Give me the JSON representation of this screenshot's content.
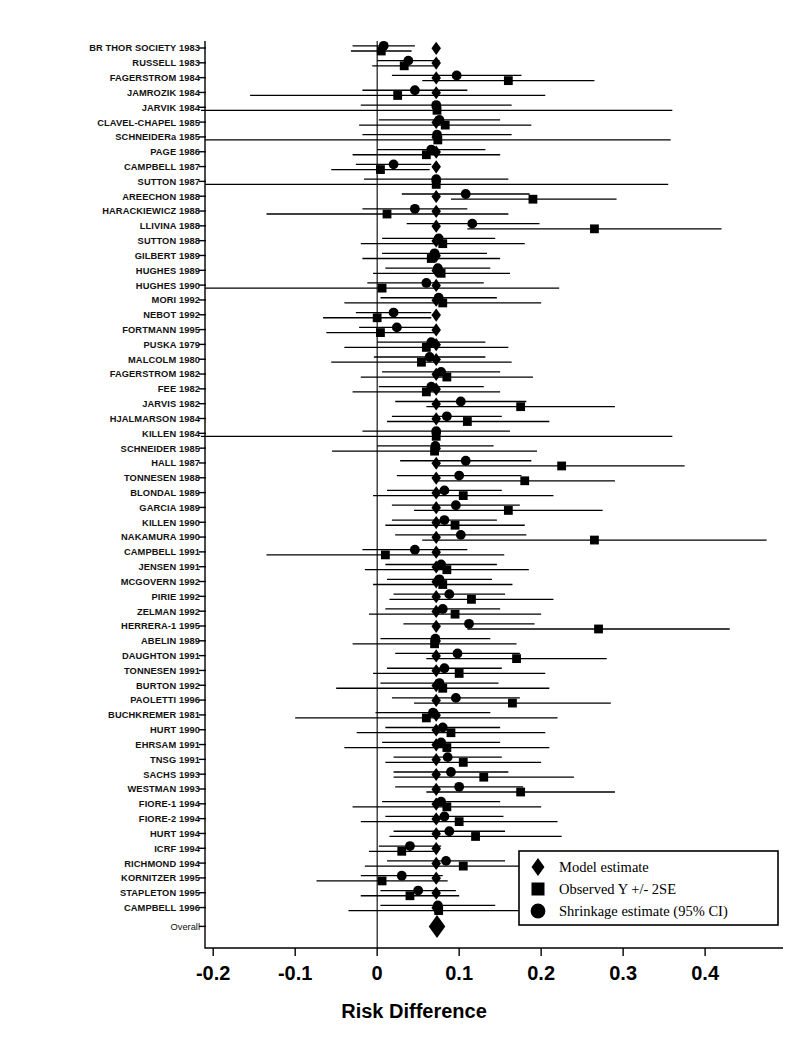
{
  "figure": {
    "type": "forest-plot",
    "background": "#ffffff",
    "ink_color": "#000000",
    "width": 787,
    "height": 1043
  },
  "axis": {
    "title": "Risk Difference",
    "tick_labels": [
      "-0.2",
      "-0.1",
      "0",
      "0.1",
      "0.2",
      "0.3",
      "0.4"
    ],
    "tick_values": [
      -0.2,
      -0.1,
      0,
      0.1,
      0.2,
      0.3,
      0.4
    ],
    "xlim": [
      -0.21,
      0.495
    ],
    "reference_line": 0
  },
  "legend": {
    "position": "bottom-right",
    "items": [
      {
        "marker": "diamond",
        "label": "Model estimate"
      },
      {
        "marker": "square",
        "label": "Observed Y +/- 2SE"
      },
      {
        "marker": "circle",
        "label": "Shrinkage estimate (95% CI)"
      }
    ]
  },
  "overall": {
    "label": "Overall",
    "model_estimate": 0.073
  },
  "chart_data": {
    "type": "scatter",
    "title": "",
    "xlabel": "Risk Difference",
    "ylabel": "",
    "xlim": [
      -0.21,
      0.495
    ],
    "grid": false,
    "legend_position": "bottom-right",
    "series": [
      {
        "name": "Model estimate",
        "marker": "diamond"
      },
      {
        "name": "Observed Y +/- 2SE",
        "marker": "square"
      },
      {
        "name": "Shrinkage estimate (95% CI)",
        "marker": "circle"
      }
    ],
    "categories": [
      "BR THOR SOCIETY 1983",
      "RUSSELL 1983",
      "FAGERSTROM 1984",
      "JAMROZIK 1984",
      "JARVIK 1984",
      "CLAVEL-CHAPEL 1985",
      "SCHNEIDERa 1985",
      "PAGE 1986",
      "CAMPBELL 1987",
      "SUTTON 1987",
      "AREECHON 1988",
      "HARACKIEWICZ 1988",
      "LLIVINA 1988",
      "SUTTON 1988",
      "GILBERT 1989",
      "HUGHES 1989",
      "HUGHES 1990",
      "MORI 1992",
      "NEBOT 1992",
      "FORTMANN 1995",
      "PUSKA 1979",
      "MALCOLM 1980",
      "FAGERSTROM 1982",
      "FEE 1982",
      "JARVIS 1982",
      "HJALMARSON 1984",
      "KILLEN 1984",
      "SCHNEIDER 1985",
      "HALL 1987",
      "TONNESEN 1988",
      "BLONDAL 1989",
      "GARCIA 1989",
      "KILLEN 1990",
      "NAKAMURA 1990",
      "CAMPBELL 1991",
      "JENSEN 1991",
      "MCGOVERN 1992",
      "PIRIE 1992",
      "ZELMAN 1992",
      "HERRERA-1 1995",
      "ABELIN 1989",
      "DAUGHTON 1991",
      "TONNESEN 1991",
      "BURTON 1992",
      "PAOLETTI 1996",
      "BUCHKREMER 1981",
      "HURT 1990",
      "EHRSAM 1991",
      "TNSG 1991",
      "SACHS 1993",
      "WESTMAN 1993",
      "FIORE-1 1994",
      "FIORE-2 1994",
      "HURT 1994",
      "ICRF 1994",
      "RICHMOND 1994",
      "KORNITZER 1995",
      "STAPLETON 1995",
      "CAMPBELL 1996"
    ],
    "rows": [
      {
        "study": "BR THOR SOCIETY 1983",
        "model": 0.072,
        "observed": 0.005,
        "se_lo": -0.032,
        "se_hi": 0.042,
        "shrink": 0.008,
        "ci_lo": -0.03,
        "ci_hi": 0.046
      },
      {
        "study": "RUSSELL 1983",
        "model": 0.072,
        "observed": 0.033,
        "se_lo": -0.006,
        "se_hi": 0.072,
        "shrink": 0.038,
        "ci_lo": 0.0,
        "ci_hi": 0.076
      },
      {
        "study": "FAGERSTROM 1984",
        "model": 0.072,
        "observed": 0.16,
        "se_lo": 0.055,
        "se_hi": 0.265,
        "shrink": 0.097,
        "ci_lo": 0.018,
        "ci_hi": 0.176
      },
      {
        "study": "JAMROZIK 1984",
        "model": 0.072,
        "observed": 0.025,
        "se_lo": -0.155,
        "se_hi": 0.205,
        "shrink": 0.046,
        "ci_lo": -0.018,
        "ci_hi": 0.11
      },
      {
        "study": "JARVIK 1984",
        "model": 0.072,
        "observed": 0.073,
        "se_lo": -0.215,
        "se_hi": 0.36,
        "shrink": 0.072,
        "ci_lo": -0.02,
        "ci_hi": 0.164
      },
      {
        "study": "CLAVEL-CHAPEL 1985",
        "model": 0.072,
        "observed": 0.083,
        "se_lo": -0.022,
        "se_hi": 0.188,
        "shrink": 0.076,
        "ci_lo": 0.002,
        "ci_hi": 0.15
      },
      {
        "study": "SCHNEIDERa 1985",
        "model": 0.072,
        "observed": 0.074,
        "se_lo": -0.21,
        "se_hi": 0.358,
        "shrink": 0.073,
        "ci_lo": -0.018,
        "ci_hi": 0.164
      },
      {
        "study": "PAGE 1986",
        "model": 0.072,
        "observed": 0.06,
        "se_lo": -0.03,
        "se_hi": 0.15,
        "shrink": 0.066,
        "ci_lo": 0.0,
        "ci_hi": 0.132
      },
      {
        "study": "CAMPBELL 1987",
        "model": 0.072,
        "observed": 0.004,
        "se_lo": -0.056,
        "se_hi": 0.064,
        "shrink": 0.02,
        "ci_lo": -0.026,
        "ci_hi": 0.066
      },
      {
        "study": "SUTTON 1987",
        "model": 0.072,
        "observed": 0.072,
        "se_lo": -0.21,
        "se_hi": 0.355,
        "shrink": 0.072,
        "ci_lo": -0.016,
        "ci_hi": 0.16
      },
      {
        "study": "AREECHON 1988",
        "model": 0.072,
        "observed": 0.19,
        "se_lo": 0.09,
        "se_hi": 0.292,
        "shrink": 0.108,
        "ci_lo": 0.03,
        "ci_hi": 0.186
      },
      {
        "study": "HARACKIEWICZ 1988",
        "model": 0.072,
        "observed": 0.012,
        "se_lo": -0.135,
        "se_hi": 0.16,
        "shrink": 0.046,
        "ci_lo": -0.018,
        "ci_hi": 0.11
      },
      {
        "study": "LLIVINA 1988",
        "model": 0.072,
        "observed": 0.265,
        "se_lo": 0.11,
        "se_hi": 0.42,
        "shrink": 0.116,
        "ci_lo": 0.036,
        "ci_hi": 0.198
      },
      {
        "study": "SUTTON 1988",
        "model": 0.072,
        "observed": 0.08,
        "se_lo": -0.02,
        "se_hi": 0.18,
        "shrink": 0.075,
        "ci_lo": 0.006,
        "ci_hi": 0.144
      },
      {
        "study": "GILBERT 1989",
        "model": 0.072,
        "observed": 0.066,
        "se_lo": -0.018,
        "se_hi": 0.15,
        "shrink": 0.07,
        "ci_lo": 0.006,
        "ci_hi": 0.134
      },
      {
        "study": "HUGHES 1989",
        "model": 0.072,
        "observed": 0.078,
        "se_lo": -0.005,
        "se_hi": 0.162,
        "shrink": 0.074,
        "ci_lo": 0.01,
        "ci_hi": 0.138
      },
      {
        "study": "HUGHES 1990",
        "model": 0.072,
        "observed": 0.006,
        "se_lo": -0.21,
        "se_hi": 0.222,
        "shrink": 0.06,
        "ci_lo": -0.012,
        "ci_hi": 0.13
      },
      {
        "study": "MORI 1992",
        "model": 0.072,
        "observed": 0.08,
        "se_lo": -0.04,
        "se_hi": 0.2,
        "shrink": 0.075,
        "ci_lo": 0.004,
        "ci_hi": 0.146
      },
      {
        "study": "NEBOT 1992",
        "model": 0.072,
        "observed": 0.0,
        "se_lo": -0.066,
        "se_hi": 0.066,
        "shrink": 0.02,
        "ci_lo": -0.026,
        "ci_hi": 0.066
      },
      {
        "study": "FORTMANN 1995",
        "model": 0.072,
        "observed": 0.004,
        "se_lo": -0.062,
        "se_hi": 0.07,
        "shrink": 0.024,
        "ci_lo": -0.022,
        "ci_hi": 0.07
      },
      {
        "study": "PUSKA 1979",
        "model": 0.072,
        "observed": 0.06,
        "se_lo": -0.04,
        "se_hi": 0.16,
        "shrink": 0.066,
        "ci_lo": 0.0,
        "ci_hi": 0.132
      },
      {
        "study": "MALCOLM 1980",
        "model": 0.072,
        "observed": 0.054,
        "se_lo": -0.056,
        "se_hi": 0.164,
        "shrink": 0.064,
        "ci_lo": -0.004,
        "ci_hi": 0.132
      },
      {
        "study": "FAGERSTROM 1982",
        "model": 0.072,
        "observed": 0.085,
        "se_lo": -0.02,
        "se_hi": 0.19,
        "shrink": 0.078,
        "ci_lo": 0.006,
        "ci_hi": 0.15
      },
      {
        "study": "FEE 1982",
        "model": 0.072,
        "observed": 0.06,
        "se_lo": -0.03,
        "se_hi": 0.15,
        "shrink": 0.066,
        "ci_lo": 0.002,
        "ci_hi": 0.13
      },
      {
        "study": "JARVIS 1982",
        "model": 0.072,
        "observed": 0.175,
        "se_lo": 0.06,
        "se_hi": 0.29,
        "shrink": 0.102,
        "ci_lo": 0.022,
        "ci_hi": 0.182
      },
      {
        "study": "HJALMARSON 1984",
        "model": 0.072,
        "observed": 0.11,
        "se_lo": 0.012,
        "se_hi": 0.21,
        "shrink": 0.085,
        "ci_lo": 0.018,
        "ci_hi": 0.152
      },
      {
        "study": "KILLEN 1984",
        "model": 0.072,
        "observed": 0.072,
        "se_lo": -0.215,
        "se_hi": 0.36,
        "shrink": 0.072,
        "ci_lo": -0.018,
        "ci_hi": 0.162
      },
      {
        "study": "SCHNEIDER 1985",
        "model": 0.072,
        "observed": 0.07,
        "se_lo": -0.055,
        "se_hi": 0.195,
        "shrink": 0.071,
        "ci_lo": 0.0,
        "ci_hi": 0.142
      },
      {
        "study": "HALL 1987",
        "model": 0.072,
        "observed": 0.225,
        "se_lo": 0.075,
        "se_hi": 0.375,
        "shrink": 0.108,
        "ci_lo": 0.028,
        "ci_hi": 0.188
      },
      {
        "study": "TONNESEN 1988",
        "model": 0.072,
        "observed": 0.18,
        "se_lo": 0.07,
        "se_hi": 0.29,
        "shrink": 0.1,
        "ci_lo": 0.024,
        "ci_hi": 0.176
      },
      {
        "study": "BLONDAL 1989",
        "model": 0.072,
        "observed": 0.105,
        "se_lo": -0.005,
        "se_hi": 0.215,
        "shrink": 0.082,
        "ci_lo": 0.012,
        "ci_hi": 0.152
      },
      {
        "study": "GARCIA 1989",
        "model": 0.072,
        "observed": 0.16,
        "se_lo": 0.045,
        "se_hi": 0.275,
        "shrink": 0.096,
        "ci_lo": 0.018,
        "ci_hi": 0.174
      },
      {
        "study": "KILLEN 1990",
        "model": 0.072,
        "observed": 0.095,
        "se_lo": 0.01,
        "se_hi": 0.18,
        "shrink": 0.082,
        "ci_lo": 0.018,
        "ci_hi": 0.146
      },
      {
        "study": "NAKAMURA 1990",
        "model": 0.072,
        "observed": 0.265,
        "se_lo": 0.055,
        "se_hi": 0.475,
        "shrink": 0.102,
        "ci_lo": 0.022,
        "ci_hi": 0.182
      },
      {
        "study": "CAMPBELL 1991",
        "model": 0.072,
        "observed": 0.01,
        "se_lo": -0.135,
        "se_hi": 0.155,
        "shrink": 0.046,
        "ci_lo": -0.018,
        "ci_hi": 0.11
      },
      {
        "study": "JENSEN 1991",
        "model": 0.072,
        "observed": 0.085,
        "se_lo": -0.015,
        "se_hi": 0.185,
        "shrink": 0.078,
        "ci_lo": 0.01,
        "ci_hi": 0.146
      },
      {
        "study": "MCGOVERN 1992",
        "model": 0.072,
        "observed": 0.08,
        "se_lo": -0.005,
        "se_hi": 0.165,
        "shrink": 0.076,
        "ci_lo": 0.012,
        "ci_hi": 0.14
      },
      {
        "study": "PIRIE 1992",
        "model": 0.072,
        "observed": 0.115,
        "se_lo": 0.015,
        "se_hi": 0.215,
        "shrink": 0.088,
        "ci_lo": 0.02,
        "ci_hi": 0.156
      },
      {
        "study": "ZELMAN 1992",
        "model": 0.072,
        "observed": 0.095,
        "se_lo": -0.01,
        "se_hi": 0.2,
        "shrink": 0.08,
        "ci_lo": 0.01,
        "ci_hi": 0.15
      },
      {
        "study": "HERRERA-1 1995",
        "model": 0.072,
        "observed": 0.27,
        "se_lo": 0.11,
        "se_hi": 0.43,
        "shrink": 0.112,
        "ci_lo": 0.032,
        "ci_hi": 0.192
      },
      {
        "study": "ABELIN 1989",
        "model": 0.072,
        "observed": 0.07,
        "se_lo": -0.03,
        "se_hi": 0.17,
        "shrink": 0.071,
        "ci_lo": 0.004,
        "ci_hi": 0.138
      },
      {
        "study": "DAUGHTON 1991",
        "model": 0.072,
        "observed": 0.17,
        "se_lo": 0.06,
        "se_hi": 0.28,
        "shrink": 0.098,
        "ci_lo": 0.022,
        "ci_hi": 0.174
      },
      {
        "study": "TONNESEN 1991",
        "model": 0.072,
        "observed": 0.1,
        "se_lo": -0.005,
        "se_hi": 0.205,
        "shrink": 0.082,
        "ci_lo": 0.012,
        "ci_hi": 0.152
      },
      {
        "study": "BURTON 1992",
        "model": 0.072,
        "observed": 0.08,
        "se_lo": -0.05,
        "se_hi": 0.21,
        "shrink": 0.076,
        "ci_lo": 0.004,
        "ci_hi": 0.148
      },
      {
        "study": "PAOLETTI 1996",
        "model": 0.072,
        "observed": 0.165,
        "se_lo": 0.045,
        "se_hi": 0.285,
        "shrink": 0.096,
        "ci_lo": 0.018,
        "ci_hi": 0.174
      },
      {
        "study": "BUCHKREMER 1981",
        "model": 0.072,
        "observed": 0.06,
        "se_lo": -0.1,
        "se_hi": 0.22,
        "shrink": 0.068,
        "ci_lo": -0.002,
        "ci_hi": 0.138
      },
      {
        "study": "HURT 1990",
        "model": 0.072,
        "observed": 0.09,
        "se_lo": -0.025,
        "se_hi": 0.205,
        "shrink": 0.08,
        "ci_lo": 0.01,
        "ci_hi": 0.15
      },
      {
        "study": "EHRSAM 1991",
        "model": 0.072,
        "observed": 0.085,
        "se_lo": -0.04,
        "se_hi": 0.21,
        "shrink": 0.078,
        "ci_lo": 0.006,
        "ci_hi": 0.15
      },
      {
        "study": "TNSG 1991",
        "model": 0.072,
        "observed": 0.105,
        "se_lo": 0.01,
        "se_hi": 0.2,
        "shrink": 0.086,
        "ci_lo": 0.02,
        "ci_hi": 0.152
      },
      {
        "study": "SACHS 1993",
        "model": 0.072,
        "observed": 0.13,
        "se_lo": 0.02,
        "se_hi": 0.24,
        "shrink": 0.09,
        "ci_lo": 0.02,
        "ci_hi": 0.16
      },
      {
        "study": "WESTMAN 1993",
        "model": 0.072,
        "observed": 0.175,
        "se_lo": 0.06,
        "se_hi": 0.29,
        "shrink": 0.1,
        "ci_lo": 0.022,
        "ci_hi": 0.178
      },
      {
        "study": "FIORE-1 1994",
        "model": 0.072,
        "observed": 0.085,
        "se_lo": -0.03,
        "se_hi": 0.2,
        "shrink": 0.078,
        "ci_lo": 0.006,
        "ci_hi": 0.15
      },
      {
        "study": "FIORE-2 1994",
        "model": 0.072,
        "observed": 0.1,
        "se_lo": -0.02,
        "se_hi": 0.22,
        "shrink": 0.082,
        "ci_lo": 0.01,
        "ci_hi": 0.154
      },
      {
        "study": "HURT 1994",
        "model": 0.072,
        "observed": 0.12,
        "se_lo": 0.015,
        "se_hi": 0.225,
        "shrink": 0.088,
        "ci_lo": 0.02,
        "ci_hi": 0.156
      },
      {
        "study": "ICRF 1994",
        "model": 0.072,
        "observed": 0.03,
        "se_lo": -0.01,
        "se_hi": 0.07,
        "shrink": 0.04,
        "ci_lo": 0.002,
        "ci_hi": 0.078
      },
      {
        "study": "RICHMOND 1994",
        "model": 0.072,
        "observed": 0.105,
        "se_lo": -0.015,
        "se_hi": 0.225,
        "shrink": 0.084,
        "ci_lo": 0.012,
        "ci_hi": 0.156
      },
      {
        "study": "KORNITZER 1995",
        "model": 0.072,
        "observed": 0.006,
        "se_lo": -0.074,
        "se_hi": 0.086,
        "shrink": 0.03,
        "ci_lo": -0.02,
        "ci_hi": 0.08
      },
      {
        "study": "STAPLETON 1995",
        "model": 0.072,
        "observed": 0.04,
        "se_lo": -0.02,
        "se_hi": 0.1,
        "shrink": 0.05,
        "ci_lo": 0.004,
        "ci_hi": 0.096
      },
      {
        "study": "CAMPBELL 1996",
        "model": 0.072,
        "observed": 0.075,
        "se_lo": -0.035,
        "se_hi": 0.185,
        "shrink": 0.074,
        "ci_lo": 0.004,
        "ci_hi": 0.144
      }
    ],
    "overall_row": {
      "study": "Overall",
      "model": 0.073
    }
  }
}
